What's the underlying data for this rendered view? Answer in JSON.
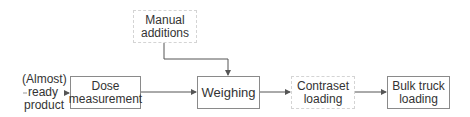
{
  "diagram": {
    "type": "process-flow",
    "source": {
      "label_lines": [
        "(Almost)",
        "ready",
        "product"
      ]
    },
    "nodes": [
      {
        "id": "manual",
        "label_lines": [
          "Manual",
          "additions"
        ],
        "style": "dashed"
      },
      {
        "id": "dose",
        "label_lines": [
          "Dose",
          "measurement"
        ],
        "style": "solid"
      },
      {
        "id": "weighing",
        "label_lines": [
          "Weighing"
        ],
        "style": "solid"
      },
      {
        "id": "contraset",
        "label_lines": [
          "Contraset",
          "loading"
        ],
        "style": "dashed"
      },
      {
        "id": "bulk",
        "label_lines": [
          "Bulk truck",
          "loading"
        ],
        "style": "solid"
      }
    ],
    "edges": [
      {
        "from": "source",
        "to": "dose"
      },
      {
        "from": "dose",
        "to": "weighing"
      },
      {
        "from": "manual",
        "to": "weighing"
      },
      {
        "from": "weighing",
        "to": "contraset"
      },
      {
        "from": "contraset",
        "to": "bulk"
      }
    ],
    "colors": {
      "line": "#555555",
      "solid_border": "#8a8a8a",
      "dashed_border": "#d4d4d4",
      "text": "#333333"
    }
  }
}
